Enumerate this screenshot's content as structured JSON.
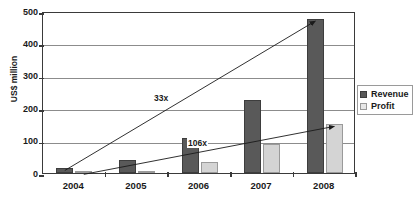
{
  "chart_data": {
    "type": "bar",
    "title": "",
    "xlabel": "",
    "ylabel": "US$ million",
    "categories": [
      "2004",
      "2005",
      "2006",
      "2007",
      "2008"
    ],
    "series": [
      {
        "name": "Revenue",
        "color": "#595959",
        "values": [
          14,
          40,
          107,
          225,
          475
        ]
      },
      {
        "name": "Profit",
        "color": "#d4d4d4",
        "values": [
          2,
          5,
          35,
          90,
          150
        ]
      }
    ],
    "ylim": [
      0,
      500
    ],
    "yticks": [
      0,
      100,
      200,
      300,
      400,
      500
    ],
    "ytick_labels": [
      "0",
      "100",
      "200",
      "300",
      "400",
      "500"
    ],
    "grid": true,
    "legend_position": "right",
    "annotations": [
      {
        "label": "33x",
        "from": {
          "x": "2004",
          "y": 14
        },
        "to": {
          "x": "2008",
          "y": 475
        }
      },
      {
        "label": "106x",
        "from": {
          "x": "2004",
          "y": 2
        },
        "to": {
          "x": "2008",
          "y": 150
        }
      }
    ]
  },
  "legend": {
    "items": [
      {
        "label": "Revenue"
      },
      {
        "label": "Profit"
      }
    ]
  }
}
